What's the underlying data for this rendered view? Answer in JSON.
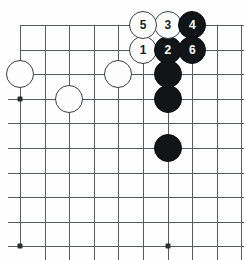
{
  "figure": {
    "kind": "go-board-diagram",
    "width": 244,
    "height": 260
  },
  "board": {
    "grid_spacing": 24.6,
    "origin_x": 20,
    "origin_y": 25,
    "columns": 10,
    "rows": 10,
    "line_color": "#555b5e",
    "background_color": "#fefefe",
    "columns_x": [
      20,
      44.6,
      69.2,
      93.8,
      118.4,
      143,
      167.6,
      192.2,
      216.8,
      241.4
    ],
    "rows_y": [
      25,
      49.6,
      74.2,
      98.8,
      123.4,
      148,
      172.6,
      197.2,
      221.8,
      246.4
    ],
    "vertical_lines": [
      {
        "x": 20,
        "y1": 25,
        "y2": 246.4
      },
      {
        "x": 44.6,
        "y1": 25,
        "y2": 260
      },
      {
        "x": 69.2,
        "y1": 25,
        "y2": 260
      },
      {
        "x": 93.8,
        "y1": 25,
        "y2": 260
      },
      {
        "x": 118.4,
        "y1": 25,
        "y2": 260
      },
      {
        "x": 143,
        "y1": 25,
        "y2": 260
      },
      {
        "x": 167.6,
        "y1": 25,
        "y2": 260
      },
      {
        "x": 192.2,
        "y1": 25,
        "y2": 260
      },
      {
        "x": 216.8,
        "y1": 25,
        "y2": 260
      },
      {
        "x": 241.4,
        "y1": 25,
        "y2": 260
      }
    ],
    "horizontal_lines": [
      {
        "y": 25,
        "x1": 20,
        "x2": 244
      },
      {
        "y": 49.6,
        "x1": 20,
        "x2": 244
      },
      {
        "y": 74.2,
        "x1": 8,
        "x2": 244
      },
      {
        "y": 98.8,
        "x1": 8,
        "x2": 244
      },
      {
        "y": 123.4,
        "x1": 8,
        "x2": 244
      },
      {
        "y": 148,
        "x1": 8,
        "x2": 244
      },
      {
        "y": 172.6,
        "x1": 8,
        "x2": 244
      },
      {
        "y": 197.2,
        "x1": 8,
        "x2": 244
      },
      {
        "y": 221.8,
        "x1": 8,
        "x2": 244
      },
      {
        "y": 246.4,
        "x1": 8,
        "x2": 244
      }
    ],
    "star_points": [
      {
        "name": "star-point-left",
        "x": 20,
        "y": 98.8
      },
      {
        "name": "star-point-bottom-left",
        "x": 20,
        "y": 246.4
      },
      {
        "name": "star-point-bottom-right",
        "x": 167.6,
        "y": 246.4
      }
    ]
  },
  "stones": [
    {
      "id": "white-stone-a",
      "color": "white",
      "label": "",
      "x": 20,
      "y": 74.2,
      "radius": 14
    },
    {
      "id": "white-stone-b",
      "color": "white",
      "label": "",
      "x": 69.2,
      "y": 98.8,
      "radius": 14
    },
    {
      "id": "white-stone-c",
      "color": "white",
      "label": "",
      "x": 118.4,
      "y": 74.2,
      "radius": 14
    },
    {
      "id": "black-stone-a",
      "color": "black",
      "label": "",
      "x": 167.6,
      "y": 74.2,
      "radius": 14
    },
    {
      "id": "black-stone-b",
      "color": "black",
      "label": "",
      "x": 167.6,
      "y": 98.8,
      "radius": 14
    },
    {
      "id": "black-stone-c",
      "color": "black",
      "label": "",
      "x": 167.6,
      "y": 148,
      "radius": 14
    },
    {
      "id": "move-1",
      "color": "white",
      "label": "1",
      "x": 143,
      "y": 49.6,
      "radius": 14
    },
    {
      "id": "move-2",
      "color": "black",
      "label": "2",
      "x": 167.6,
      "y": 49.6,
      "radius": 14
    },
    {
      "id": "move-3",
      "color": "white",
      "label": "3",
      "x": 167.6,
      "y": 25,
      "radius": 14
    },
    {
      "id": "move-4",
      "color": "black",
      "label": "4",
      "x": 192.2,
      "y": 25,
      "radius": 14
    },
    {
      "id": "move-5",
      "color": "white",
      "label": "5",
      "x": 143,
      "y": 25,
      "radius": 14
    },
    {
      "id": "move-6",
      "color": "black",
      "label": "6",
      "x": 192.2,
      "y": 49.6,
      "radius": 14
    }
  ]
}
